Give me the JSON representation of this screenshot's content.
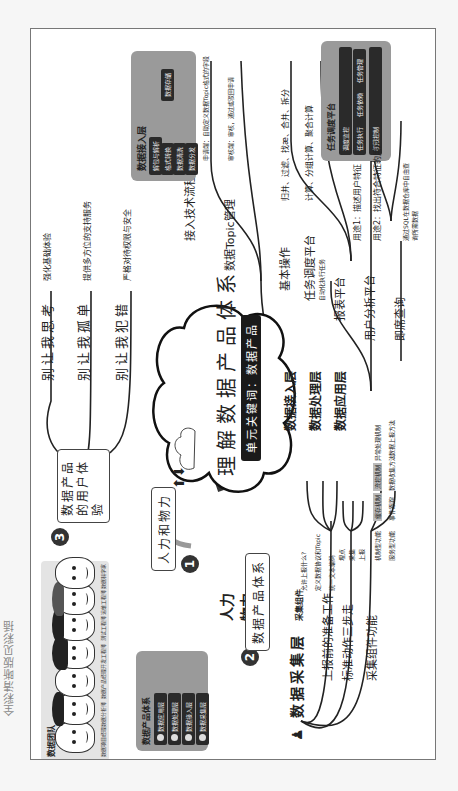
{
  "caption": "全彩清晰版见彩插",
  "center": {
    "title": "理解数据产品体系",
    "keyword": "单元关键词：数据产品"
  },
  "branch1": {
    "number": "1",
    "label": "人力和物力",
    "items": [
      "人力",
      "物力"
    ],
    "team": {
      "title": "数据团队",
      "roles": [
        "数据项目经理",
        "数据分析师",
        "数据产品经理",
        "开发工程师",
        "测试工程师",
        "运维工程师",
        "数据科学家"
      ]
    },
    "system": {
      "title": "数据产品体系",
      "layers": [
        "数据应用层",
        "数据处理层",
        "数据接入层",
        "数据采集层"
      ]
    }
  },
  "branch2": {
    "number": "2",
    "label": "数据产品体系",
    "collect": {
      "title": "数据采集层",
      "subtitle": "采集组件",
      "prep": {
        "label": "上报前的准备工作",
        "items": [
          "允许上报什么?",
          "定义数据协议和Topic",
          "统一文本编码"
        ]
      },
      "steps": {
        "label": "标准动作三步走",
        "items": [
          "埋点",
          "采集",
          "上报"
        ]
      },
      "functions": {
        "label": "采集组件功能",
        "groups": [
          {
            "label": "机制型功能",
            "items": [
              "缓存机制",
              "流控机制",
              "异常处理机制"
            ]
          },
          {
            "label": "服务型功能",
            "items": [
              "事件跟踪",
              "数据收集方法",
              "数据上报方法"
            ]
          }
        ]
      }
    },
    "access": {
      "title": "数据接入层",
      "flow": {
        "label": "接入技术流程",
        "panel_title": "数据接入层",
        "steps": [
          "解包与解析",
          "格式转换",
          "数据清洗",
          "数据分发"
        ],
        "target": "数据存储"
      },
      "topic": {
        "label": "数据Topic管理",
        "items": [
          "申请端：自助定义数据Topic格式的字段",
          "审核端：审核，通过或驳回申请"
        ]
      }
    },
    "process": {
      "title": "数据处理层",
      "basic": {
        "label": "基本操作",
        "items": [
          "归并、过滤、找æ、合并、拆分",
          "计算、分组计算、聚合计算"
        ]
      },
      "scheduler": {
        "label": "任务调度平台",
        "sub": "自动化执行任务",
        "panel_title": "任务调度平台",
        "left": "调度监控",
        "mid": [
          "任务执行",
          "任务依赖",
          "任务管理"
        ],
        "right": "权限控制"
      }
    },
    "apply": {
      "title": "数据应用层",
      "report": "报表平台",
      "user_analysis": {
        "label": "用户分析平台",
        "items": [
          "用途1：描述用户特征",
          "用途2：找出符合特征的用户"
        ]
      },
      "adhoc": {
        "label": "即席查询",
        "desc": "通过SQL在数据仓库中自由查询所需数据"
      }
    }
  },
  "branch3": {
    "number": "3",
    "label": "数据产品的用户体验",
    "items": [
      {
        "label": "别让我思考",
        "desc": "强化基础体验"
      },
      {
        "label": "别让我孤单",
        "desc": "提供多方位的支持服务"
      },
      {
        "label": "别让我犯错",
        "desc": "严格对待权限与安全"
      }
    ]
  },
  "colors": {
    "panel": "#9a9a9a",
    "chip": "#2a2a2a",
    "line": "#222222",
    "team_bg": "#e4e4e4"
  }
}
